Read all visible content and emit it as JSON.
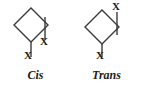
{
  "figure": {
    "name": "cis-trans-disubstituted-cyclobutane",
    "background_color": "#ffffff",
    "line_color": "#3a3a3a",
    "text_color": "#1b1b1b"
  },
  "structures": [
    {
      "id": "cis",
      "name_label": "Cis",
      "ring": "cyclobutane-rhombus",
      "substituents": [
        {
          "id": "cis-x-axial",
          "label": "X",
          "attached_vertex": "bottom",
          "direction": "down"
        },
        {
          "id": "cis-x-equatorial",
          "label": "X",
          "attached_vertex": "right",
          "direction": "down"
        }
      ]
    },
    {
      "id": "trans",
      "name_label": "Trans",
      "ring": "cyclobutane-rhombus",
      "substituents": [
        {
          "id": "trans-x-down",
          "label": "X",
          "attached_vertex": "bottom",
          "direction": "down"
        },
        {
          "id": "trans-x-up",
          "label": "X",
          "attached_vertex": "right",
          "direction": "up"
        }
      ]
    }
  ]
}
